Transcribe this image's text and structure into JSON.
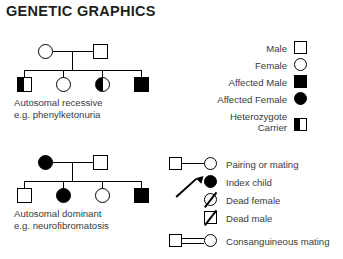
{
  "title": "GENETIC GRAPHICS",
  "pedigrees": [
    {
      "id": "autosomal-recessive",
      "caption_line1": "Autosomal recessive",
      "caption_line2": "e.g. phenylketonuria",
      "parents": [
        {
          "sex": "female",
          "status": "unaffected"
        },
        {
          "sex": "male",
          "status": "unaffected"
        }
      ],
      "children": [
        {
          "sex": "male",
          "status": "carrier"
        },
        {
          "sex": "female",
          "status": "unaffected"
        },
        {
          "sex": "female",
          "status": "carrier"
        },
        {
          "sex": "male",
          "status": "affected"
        }
      ]
    },
    {
      "id": "autosomal-dominant",
      "caption_line1": "Autosomal dominant",
      "caption_line2": "e.g. neurofibromatosis",
      "parents": [
        {
          "sex": "female",
          "status": "affected"
        },
        {
          "sex": "male",
          "status": "unaffected"
        }
      ],
      "children": [
        {
          "sex": "male",
          "status": "unaffected"
        },
        {
          "sex": "female",
          "status": "affected"
        },
        {
          "sex": "female",
          "status": "unaffected"
        },
        {
          "sex": "male",
          "status": "affected"
        }
      ]
    }
  ],
  "legend_symbols": [
    {
      "label": "Male",
      "symbol": "open-square"
    },
    {
      "label": "Female",
      "symbol": "open-circle"
    },
    {
      "label": "Affected Male",
      "symbol": "filled-square"
    },
    {
      "label": "Affected Female",
      "symbol": "filled-circle"
    },
    {
      "label_line1": "Heterozygote",
      "label_line2": "Carrier",
      "label": "Heterozygote Carrier",
      "symbol": "half-filled-square"
    }
  ],
  "legend_relations": [
    {
      "label": "Pairing or mating",
      "symbol": "square-line-circle"
    },
    {
      "label": "Index child",
      "symbol": "arrow-to-filled-circle"
    },
    {
      "label": "Dead female",
      "symbol": "slashed-circle"
    },
    {
      "label": "Dead male",
      "symbol": "slashed-square"
    },
    {
      "label": "Consanguineous mating",
      "symbol": "square-double-line-circle"
    }
  ],
  "colors": {
    "ink": "#000000",
    "text": "#3a3a3a",
    "title": "#231f20",
    "background": "#ffffff"
  }
}
